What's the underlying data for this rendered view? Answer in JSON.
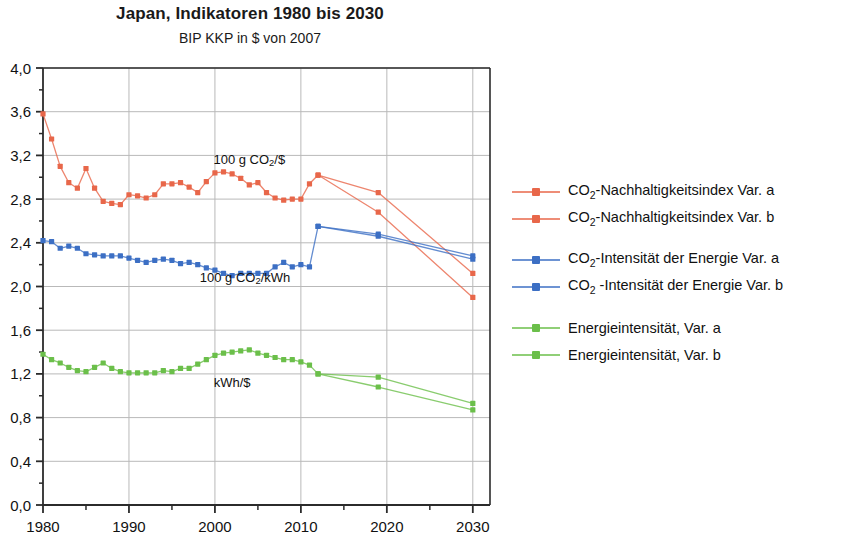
{
  "header": {
    "title": "Japan, Indikatoren 1980 bis 2030",
    "subtitle": "BIP KKP in $ von 2007"
  },
  "legend": {
    "groups": [
      {
        "color": "#E8674A",
        "items": [
          {
            "label_html": "CO<sub>2</sub>-Nachhaltigkeitsindex Var. a",
            "label": "CO2-Nachhaltigkeitsindex Var. a",
            "name": "legend-item-co2-nachhaltigkeitsindex-var-a"
          },
          {
            "label_html": "CO<sub>2</sub>-Nachhaltigkeitsindex Var. b",
            "label": "CO2-Nachhaltigkeitsindex Var. b",
            "name": "legend-item-co2-nachhaltigkeitsindex-var-b"
          }
        ]
      },
      {
        "color": "#3C6FC4",
        "items": [
          {
            "label_html": "CO<sub>2</sub>-Intensität der Energie Var. a",
            "label": "CO2-Intensitat der Energie Var. a",
            "name": "legend-item-co2-intensitaet-var-a"
          },
          {
            "label_html": "CO<sub>2</sub> -Intensität der Energie Var. b",
            "label": "CO2 -Intensitat der Energie Var. b",
            "name": "legend-item-co2-intensitaet-var-b"
          }
        ]
      },
      {
        "color": "#6BBF4A",
        "items": [
          {
            "label_html": "Energieintensität, Var. a",
            "label": "Energieintensitat, Var. a",
            "name": "legend-item-energieintensitaet-var-a"
          },
          {
            "label_html": "Energieintensität, Var. b",
            "label": "Energieintensitat, Var. b",
            "name": "legend-item-energieintensitaet-var-b"
          }
        ]
      }
    ]
  },
  "chart_data": {
    "type": "line",
    "title": "Japan, Indikatoren 1980 bis 2030",
    "subtitle": "BIP KKP in $ von 2007",
    "xlabel": "",
    "ylabel": "",
    "xlim": [
      1980,
      2032
    ],
    "ylim": [
      0.0,
      4.0
    ],
    "grid": true,
    "legend_position": "right",
    "y_ticks": [
      "0,0",
      "0,4",
      "0,8",
      "1,2",
      "1,6",
      "2,0",
      "2,4",
      "2,8",
      "3,2",
      "3,6",
      "4,0"
    ],
    "y_tick_values": [
      0.0,
      0.4,
      0.8,
      1.2,
      1.6,
      2.0,
      2.4,
      2.8,
      3.2,
      3.6,
      4.0
    ],
    "y_minor_values": [
      0.2,
      0.6,
      1.0,
      1.4,
      1.8,
      2.2,
      2.6,
      3.0,
      3.4,
      3.8
    ],
    "x_ticks": [
      "1980",
      "1990",
      "2000",
      "2010",
      "2020",
      "2030"
    ],
    "x_tick_values": [
      1980,
      1990,
      2000,
      2010,
      2020,
      2030
    ],
    "x_minor_values": [
      1985,
      1995,
      2005,
      2015,
      2025
    ],
    "annotations": [
      {
        "text_html": "100 g CO<sub>2</sub>/$",
        "text": "100 g CO2/$",
        "x": 2004.0,
        "y": 3.12,
        "name": "annotation-co2-per-dollar"
      },
      {
        "text_html": "100 g CO<sub>2</sub>/kWh",
        "text": "100 g CO2/kWh",
        "x": 2003.5,
        "y": 2.04,
        "name": "annotation-co2-per-kwh"
      },
      {
        "text_html": "kWh/$",
        "text": "kWh/$",
        "x": 2002.0,
        "y": 1.08,
        "name": "annotation-kwh-per-dollar"
      }
    ],
    "series": [
      {
        "name": "CO2-Nachhaltigkeitsindex Var. a",
        "color": "#E8674A",
        "x": [
          1980,
          1981,
          1982,
          1983,
          1984,
          1985,
          1986,
          1987,
          1988,
          1989,
          1990,
          1991,
          1992,
          1993,
          1994,
          1995,
          1996,
          1997,
          1998,
          1999,
          2000,
          2001,
          2002,
          2003,
          2004,
          2005,
          2006,
          2007,
          2008,
          2009,
          2010,
          2011,
          2012,
          2019,
          2030
        ],
        "values": [
          3.58,
          3.35,
          3.1,
          2.95,
          2.9,
          3.08,
          2.9,
          2.78,
          2.76,
          2.75,
          2.84,
          2.83,
          2.81,
          2.84,
          2.94,
          2.94,
          2.95,
          2.91,
          2.86,
          2.96,
          3.04,
          3.05,
          3.03,
          2.99,
          2.93,
          2.95,
          2.86,
          2.81,
          2.79,
          2.8,
          2.8,
          2.94,
          3.02,
          2.86,
          2.12
        ]
      },
      {
        "name": "CO2-Nachhaltigkeitsindex Var. b",
        "color": "#E8674A",
        "x": [
          2012,
          2019,
          2030
        ],
        "values": [
          3.02,
          2.68,
          1.9
        ]
      },
      {
        "name": "CO2-Intensität der Energie Var. a",
        "color": "#3C6FC4",
        "x": [
          1980,
          1981,
          1982,
          1983,
          1984,
          1985,
          1986,
          1987,
          1988,
          1989,
          1990,
          1991,
          1992,
          1993,
          1994,
          1995,
          1996,
          1997,
          1998,
          1999,
          2000,
          2001,
          2002,
          2003,
          2004,
          2005,
          2006,
          2007,
          2008,
          2009,
          2010,
          2011,
          2012,
          2019,
          2030
        ],
        "values": [
          2.42,
          2.41,
          2.35,
          2.37,
          2.35,
          2.3,
          2.29,
          2.28,
          2.28,
          2.28,
          2.26,
          2.24,
          2.22,
          2.24,
          2.25,
          2.24,
          2.21,
          2.22,
          2.2,
          2.17,
          2.15,
          2.12,
          2.1,
          2.12,
          2.12,
          2.12,
          2.12,
          2.18,
          2.22,
          2.18,
          2.2,
          2.18,
          2.55,
          2.48,
          2.28
        ]
      },
      {
        "name": "CO2-Intensität der Energie Var. b",
        "color": "#3C6FC4",
        "x": [
          2012,
          2019,
          2030
        ],
        "values": [
          2.55,
          2.46,
          2.25
        ]
      },
      {
        "name": "Energieintensität, Var. a",
        "color": "#6BBF4A",
        "x": [
          1980,
          1981,
          1982,
          1983,
          1984,
          1985,
          1986,
          1987,
          1988,
          1989,
          1990,
          1991,
          1992,
          1993,
          1994,
          1995,
          1996,
          1997,
          1998,
          1999,
          2000,
          2001,
          2002,
          2003,
          2004,
          2005,
          2006,
          2007,
          2008,
          2009,
          2010,
          2011,
          2012,
          2019,
          2030
        ],
        "values": [
          1.38,
          1.33,
          1.3,
          1.26,
          1.23,
          1.22,
          1.26,
          1.3,
          1.25,
          1.22,
          1.21,
          1.21,
          1.21,
          1.21,
          1.23,
          1.22,
          1.25,
          1.25,
          1.29,
          1.33,
          1.37,
          1.39,
          1.4,
          1.41,
          1.42,
          1.39,
          1.37,
          1.35,
          1.33,
          1.33,
          1.31,
          1.28,
          1.2,
          1.17,
          0.93
        ]
      },
      {
        "name": "Energieintensität, Var. b",
        "color": "#6BBF4A",
        "x": [
          2012,
          2019,
          2030
        ],
        "values": [
          1.2,
          1.08,
          0.87
        ]
      }
    ]
  }
}
